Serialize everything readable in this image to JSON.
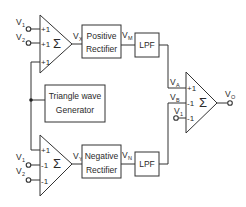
{
  "diagram": {
    "type": "block-diagram",
    "summers": {
      "top": {
        "symbol": "Σ",
        "inputs": [
          {
            "signal": "V",
            "sub": "1",
            "gain": "+1"
          },
          {
            "signal": "V",
            "sub": "2",
            "gain": "+1"
          },
          {
            "signal": "",
            "sub": "",
            "gain": "+1"
          }
        ],
        "output": {
          "signal": "V",
          "sub": "X"
        }
      },
      "bottom": {
        "symbol": "Σ",
        "inputs": [
          {
            "signal": "",
            "sub": "",
            "gain": "+1"
          },
          {
            "signal": "V",
            "sub": "1",
            "gain": "-1"
          },
          {
            "signal": "V",
            "sub": "2",
            "gain": "-1"
          }
        ],
        "output": {
          "signal": "V",
          "sub": "Y"
        }
      },
      "output": {
        "symbol": "Σ",
        "inputs": [
          {
            "signal": "V",
            "sub": "A",
            "gain": "+1"
          },
          {
            "signal": "V",
            "sub": "B",
            "gain": "-1"
          },
          {
            "signal": "V",
            "sub": "1",
            "gain": "-1"
          }
        ],
        "output": {
          "signal": "V",
          "sub": "O"
        }
      }
    },
    "blocks": {
      "positive_rectifier": {
        "line1": "Positive",
        "line2": "Rectifier",
        "output": {
          "signal": "V",
          "sub": "M"
        }
      },
      "negative_rectifier": {
        "line1": "Negative",
        "line2": "Rectifier",
        "output": {
          "signal": "V",
          "sub": "N"
        }
      },
      "lpf_top": {
        "label": "LPF"
      },
      "lpf_bottom": {
        "label": "LPF"
      },
      "triangle_generator": {
        "line1": "Triangle wave",
        "line2": "Generator"
      }
    }
  }
}
